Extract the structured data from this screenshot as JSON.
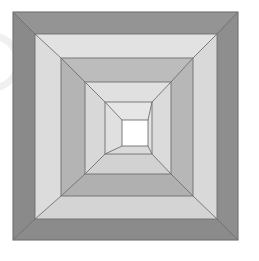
{
  "image": {
    "kind": "geometric-illustration",
    "subject": "nested-square-tunnel",
    "description": "Five concentric square rings rendered in one-point perspective, receding to a white square at the center.",
    "width": 259,
    "height": 261,
    "background_color": "#ffffff",
    "outline_color": "#6f6f6f",
    "center_square_color": "#ffffff",
    "vanishing_point": {
      "x": 135,
      "y": 133
    }
  },
  "artifact": {
    "name": "edge-arc-smudge",
    "description": "Faint light circular arc clipped at the left edge",
    "color": "#f0f0f0",
    "center_x": -8,
    "center_y": 62,
    "radius": 26
  },
  "geometry": {
    "squares": [
      {
        "index": 0,
        "name": "ring-1-outer",
        "x0": 13,
        "y0": 12,
        "x1": 238,
        "y1": 240
      },
      {
        "index": 1,
        "name": "ring-2",
        "x0": 35,
        "y0": 34,
        "x1": 217,
        "y1": 219
      },
      {
        "index": 2,
        "name": "ring-3",
        "x0": 61,
        "y0": 58,
        "x1": 193,
        "y1": 196
      },
      {
        "index": 3,
        "name": "ring-4",
        "x0": 85,
        "y0": 82,
        "x1": 171,
        "y1": 174
      },
      {
        "index": 4,
        "name": "ring-5-inner",
        "x0": 105,
        "y0": 102,
        "x1": 152,
        "y1": 154
      },
      {
        "index": 5,
        "name": "center-hole",
        "x0": 122,
        "y0": 120,
        "x1": 148,
        "y1": 146
      }
    ]
  },
  "rings": [
    {
      "index": 0,
      "name": "ring-1-outer",
      "top_color": "#949494",
      "bottom_color": "#8b8b8b",
      "left_color": "#8a8a8a",
      "right_color": "#8e8e8e"
    },
    {
      "index": 1,
      "name": "ring-2",
      "top_color": "#e2e2e2",
      "bottom_color": "#d4d4d4",
      "left_color": "#dcdcdc",
      "right_color": "#d9d9d9"
    },
    {
      "index": 2,
      "name": "ring-3",
      "top_color": "#bcbcbc",
      "bottom_color": "#b0b0b0",
      "left_color": "#b4b4b4",
      "right_color": "#b7b7b7"
    },
    {
      "index": 3,
      "name": "ring-4",
      "top_color": "#e0e0e0",
      "bottom_color": "#d2d2d2",
      "left_color": "#d8d8d8",
      "right_color": "#dbdbdb"
    },
    {
      "index": 4,
      "name": "ring-5-inner",
      "top_color": "#e6e6e6",
      "bottom_color": "#dadada",
      "left_color": "#e0e0e0",
      "right_color": "#e3e3e3"
    }
  ],
  "palette": {
    "dark_gray": "#8a8a8a",
    "mid_gray": "#b4b4b4",
    "light_gray": "#dcdcdc",
    "pale_gray": "#e0e0e0",
    "white": "#ffffff",
    "stroke": "#6f6f6f"
  }
}
